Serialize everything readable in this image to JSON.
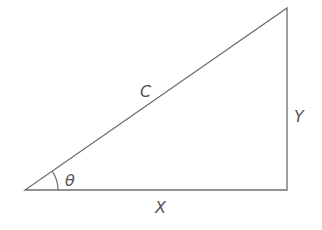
{
  "diagram": {
    "stroke_color": "#6e6e6e",
    "label_color": "#555555",
    "vertices": {
      "origin": [
        25,
        190
      ],
      "right_angle": [
        287,
        190
      ],
      "apex": [
        287,
        8
      ]
    },
    "labels": {
      "hypotenuse": "C",
      "adjacent": "X",
      "opposite": "Y",
      "angle": "θ"
    }
  }
}
